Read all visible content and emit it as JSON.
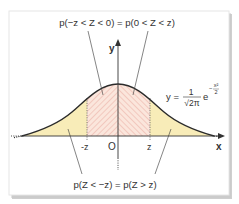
{
  "diagram": {
    "title_top": "p(−z < Z < 0) = p(0 < Z < z)",
    "title_bottom": "p(Z < −z) = p(Z > z)",
    "axis": {
      "x_label": "x",
      "y_label": "y",
      "origin_label": "O",
      "neg_z_label": "-z",
      "pos_z_label": "z"
    },
    "formula": {
      "lhs": "y =",
      "numerator": "1",
      "denominator": "√2π",
      "base": "e",
      "exponent_numerator": "x²",
      "exponent_denominator": "2",
      "exponent_sign": "−"
    },
    "colors": {
      "tail_fill": "#f8ecb8",
      "center_fill": "#fbe6dc",
      "hatch": "#e8a59a",
      "curve": "#2b2b2b",
      "axis": "#333333",
      "frame_shadow": "#a8a8a8",
      "frame_border": "#e6e6e6"
    }
  }
}
